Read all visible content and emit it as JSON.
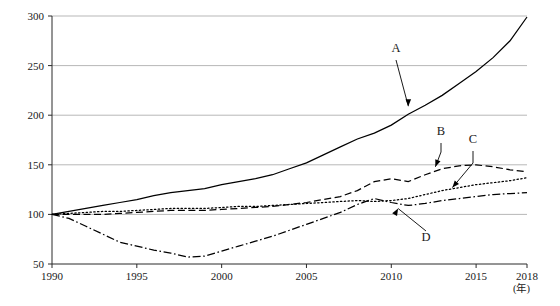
{
  "chart_data": {
    "type": "line",
    "title": "",
    "subtitle": "",
    "xlabel": "(年)",
    "ylabel": "",
    "xlim": [
      1990,
      2018
    ],
    "ylim": [
      50,
      300
    ],
    "grid": true,
    "legend_position": "inline-annotations",
    "x_ticks": [
      "1990",
      "1995",
      "2000",
      "2005",
      "2010",
      "2015",
      "2018"
    ],
    "x_tick_values": [
      1990,
      1995,
      2000,
      2005,
      2010,
      2015,
      2018
    ],
    "y_ticks": [
      "50",
      "100",
      "150",
      "200",
      "250",
      "300"
    ],
    "y_tick_values": [
      50,
      100,
      150,
      200,
      250,
      300
    ],
    "x": [
      1990,
      1991,
      1992,
      1993,
      1994,
      1995,
      1996,
      1997,
      1998,
      1999,
      2000,
      2001,
      2002,
      2003,
      2004,
      2005,
      2006,
      2007,
      2008,
      2009,
      2010,
      2011,
      2012,
      2013,
      2014,
      2015,
      2016,
      2017,
      2018
    ],
    "series": [
      {
        "name": "A",
        "label": "A",
        "style": "solid",
        "values": [
          100,
          103,
          106,
          109,
          112,
          115,
          119,
          122,
          124,
          126,
          130,
          133,
          136,
          140,
          146,
          152,
          160,
          168,
          176,
          182,
          190,
          201,
          210,
          220,
          232,
          244,
          258,
          275,
          299
        ]
      },
      {
        "name": "B",
        "label": "B",
        "style": "dashed",
        "values": [
          100,
          100,
          100,
          100,
          101,
          102,
          103,
          104,
          104,
          104,
          105,
          106,
          107,
          108,
          110,
          112,
          115,
          118,
          124,
          133,
          136,
          133,
          140,
          146,
          149,
          150,
          148,
          145,
          143
        ]
      },
      {
        "name": "C",
        "label": "C",
        "style": "dotted",
        "values": [
          100,
          101,
          102,
          103,
          103,
          104,
          105,
          106,
          106,
          106,
          107,
          108,
          108,
          109,
          110,
          111,
          112,
          113,
          114,
          113,
          114,
          116,
          120,
          124,
          127,
          130,
          132,
          134,
          137
        ]
      },
      {
        "name": "D",
        "label": "D",
        "style": "dash-dot",
        "values": [
          100,
          96,
          88,
          80,
          72,
          68,
          64,
          61,
          57,
          58,
          63,
          68,
          73,
          78,
          84,
          90,
          96,
          102,
          110,
          116,
          112,
          109,
          111,
          114,
          116,
          118,
          120,
          121,
          122
        ]
      }
    ],
    "annotations": [
      {
        "label": "A",
        "target_x": 2011,
        "target_y": 203
      },
      {
        "label": "B",
        "target_x": 2012.6,
        "target_y": 148
      },
      {
        "label": "C",
        "target_x": 2013.6,
        "target_y": 127
      },
      {
        "label": "D",
        "target_x": 2010.4,
        "target_y": 112
      }
    ]
  }
}
